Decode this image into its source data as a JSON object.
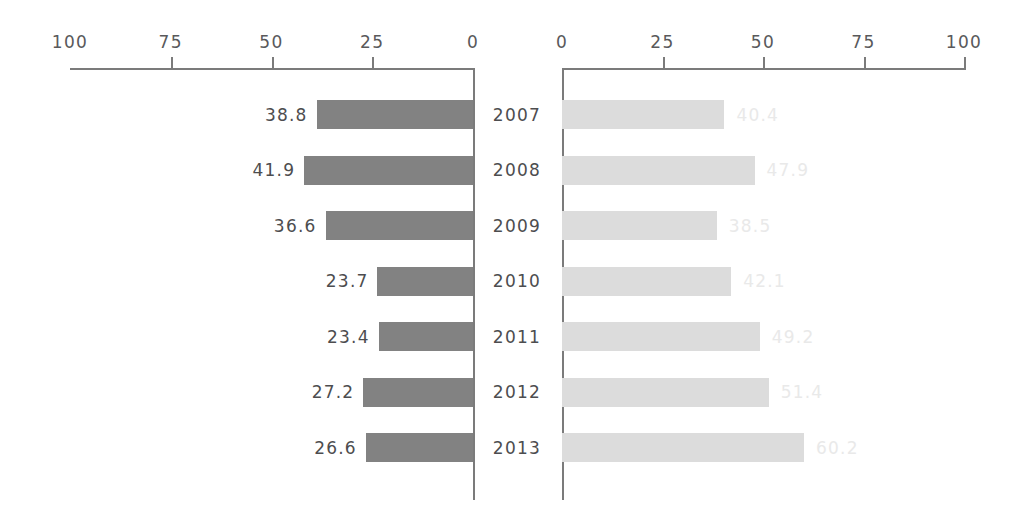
{
  "chart_data": {
    "type": "bar",
    "orientation": "horizontal",
    "layout": "diverging-pyramid",
    "title": "",
    "subtitle": "",
    "xlabel": "",
    "ylabel": "",
    "categories": [
      "2007",
      "2008",
      "2009",
      "2010",
      "2011",
      "2012",
      "2013"
    ],
    "grid": false,
    "legend": "none",
    "panels": [
      {
        "name": "left-panel",
        "direction": "right-to-left",
        "axis": {
          "ticks": [
            100,
            75,
            50,
            25,
            0
          ],
          "tick_labels": [
            "100",
            "75",
            "50",
            "25",
            "0"
          ],
          "min": 0,
          "max": 100,
          "position": "top"
        },
        "series": {
          "name": "left-series",
          "color": "#828282",
          "values": [
            38.8,
            41.9,
            36.6,
            23.7,
            23.4,
            27.2,
            26.6
          ],
          "labels": [
            "38.8",
            "41.9",
            "36.6",
            "23.7",
            "23.4",
            "27.2",
            "26.6"
          ],
          "label_position": "outside-left"
        }
      },
      {
        "name": "right-panel",
        "direction": "left-to-right",
        "axis": {
          "ticks": [
            0,
            25,
            50,
            75,
            100
          ],
          "tick_labels": [
            "0",
            "25",
            "50",
            "75",
            "100"
          ],
          "min": 0,
          "max": 100,
          "position": "top"
        },
        "series": {
          "name": "right-series",
          "color": "#dcdcdc",
          "values": [
            40.4,
            47.9,
            38.5,
            42.1,
            49.2,
            51.4,
            60.2
          ],
          "labels": [
            "40.4",
            "47.9",
            "38.5",
            "42.1",
            "49.2",
            "51.4",
            "60.2"
          ],
          "label_position": "outside-right"
        }
      }
    ]
  },
  "colors": {
    "left_bar": "#828282",
    "right_bar": "#dcdcdc",
    "axis": "#7b7b7b",
    "text": "#4d4d4f",
    "faint_text": "#e9e9e9",
    "background": "#ffffff"
  }
}
